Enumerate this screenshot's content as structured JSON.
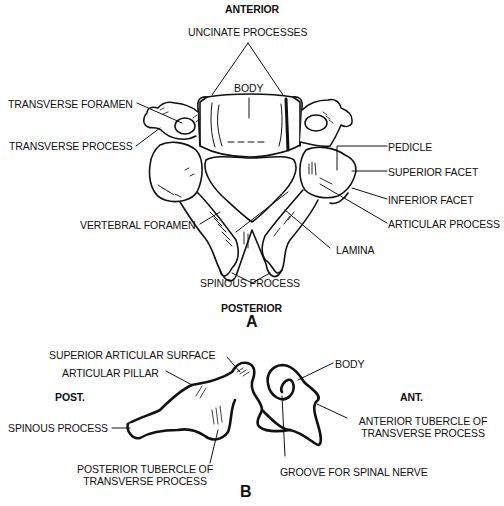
{
  "figure_a": {
    "orientation_top": "ANTERIOR",
    "orientation_bottom": "POSTERIOR",
    "panel_letter": "A",
    "labels": {
      "uncinate_processes": "UNCINATE PROCESSES",
      "body": "BODY",
      "transverse_foramen": "TRANSVERSE FORAMEN",
      "transverse_process": "TRANSVERSE PROCESS",
      "pedicle": "PEDICLE",
      "superior_facet": "SUPERIOR FACET",
      "inferior_facet": "INFERIOR FACET",
      "articular_process": "ARTICULAR PROCESS",
      "vertebral_foramen": "VERTEBRAL FORAMEN",
      "lamina": "LAMINA",
      "spinous_process": "SPINOUS PROCESS"
    }
  },
  "figure_b": {
    "orientation_left": "POST.",
    "orientation_right": "ANT.",
    "panel_letter": "B",
    "labels": {
      "superior_articular_surface": "SUPERIOR ARTICULAR SURFACE",
      "articular_pillar": "ARTICULAR PILLAR",
      "spinous_process": "SPINOUS PROCESS",
      "posterior_tubercle_line1": "POSTERIOR TUBERCLE OF",
      "posterior_tubercle_line2": "TRANSVERSE PROCESS",
      "body": "BODY",
      "anterior_tubercle_line1": "ANTERIOR TUBERCLE OF",
      "anterior_tubercle_line2": "TRANSVERSE PROCESS",
      "groove_for_spinal_nerve": "GROOVE FOR SPINAL NERVE"
    }
  },
  "colors": {
    "ink": "#111111",
    "background": "#ffffff"
  }
}
